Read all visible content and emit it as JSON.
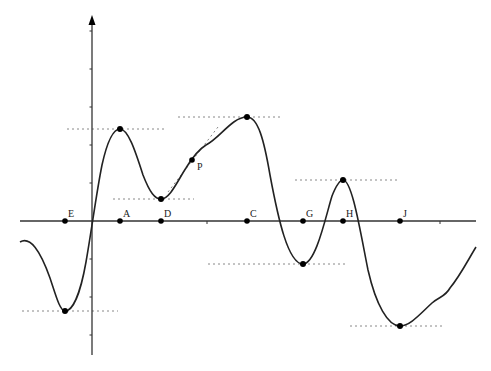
{
  "diagram": {
    "type": "function-graph",
    "colors": {
      "curve": "#222222",
      "axis": "#333333",
      "dotted": "#888888",
      "point": "#000000"
    },
    "axes": {
      "origin": {
        "x": 92,
        "y": 221
      },
      "x_axis": {
        "x1": 20,
        "x2": 476,
        "y": 221,
        "ticks": [
          207,
          440
        ]
      },
      "y_axis": {
        "x": 92,
        "y1": 355,
        "y2": 15,
        "ticks": [
          31,
          69,
          107,
          145,
          183,
          259,
          297,
          335
        ]
      }
    },
    "axis_points": [
      {
        "label": "E",
        "x": 65
      },
      {
        "label": "A",
        "x": 120
      },
      {
        "label": "D",
        "x": 161
      },
      {
        "label": "C",
        "x": 247
      },
      {
        "label": "G",
        "x": 303
      },
      {
        "label": "H",
        "x": 343
      },
      {
        "label": "J",
        "x": 400
      }
    ],
    "extrema": [
      {
        "of": "E",
        "kind": "min",
        "x": 65,
        "y": 311,
        "line": [
          22,
          118
        ]
      },
      {
        "of": "A",
        "kind": "max",
        "x": 120,
        "y": 129,
        "line": [
          67,
          166
        ]
      },
      {
        "of": "D",
        "kind": "min",
        "x": 161,
        "y": 199,
        "line": [
          113,
          194
        ]
      },
      {
        "of": "C",
        "kind": "max",
        "x": 247,
        "y": 117,
        "line": [
          178,
          282
        ]
      },
      {
        "of": "G",
        "kind": "min",
        "x": 303,
        "y": 264,
        "line": [
          208,
          348
        ]
      },
      {
        "of": "H",
        "kind": "max",
        "x": 343,
        "y": 180,
        "line": [
          295,
          400
        ]
      },
      {
        "of": "J",
        "kind": "min",
        "x": 400,
        "y": 326,
        "line": [
          350,
          444
        ]
      }
    ],
    "point_P": {
      "label": "P",
      "x": 192,
      "y": 160,
      "tangent": {
        "x1": 168,
        "y1": 192,
        "x2": 218,
        "y2": 127
      }
    }
  }
}
